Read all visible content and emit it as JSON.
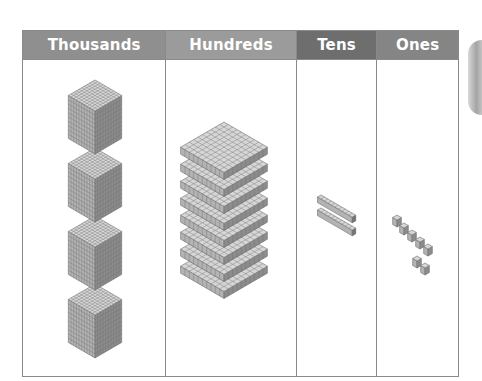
{
  "chart": {
    "columns": [
      {
        "label": "Thousands",
        "header_color": "#8f8f8f",
        "block_type": "thousand-cube",
        "count": 4
      },
      {
        "label": "Hundreds",
        "header_color": "#9b9b9b",
        "block_type": "hundred-flat",
        "count": 8
      },
      {
        "label": "Tens",
        "header_color": "#6e6e6e",
        "block_type": "ten-rod",
        "count": 2
      },
      {
        "label": "Ones",
        "header_color": "#858585",
        "block_type": "one-unit",
        "count": 7
      }
    ],
    "represented_number": "4,827"
  },
  "colors": {
    "border": "#8a8a8a",
    "block_light": "#d6d6d6",
    "block_mid": "#b3b3b3",
    "block_dark": "#8c8c8c",
    "grid_line": "#6f6f6f"
  }
}
